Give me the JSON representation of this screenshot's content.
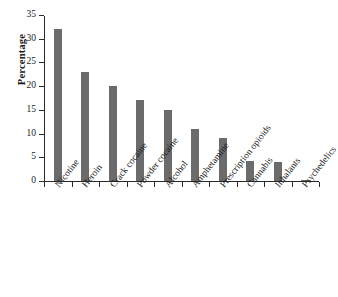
{
  "chart_data": {
    "type": "bar",
    "title": "",
    "xlabel": "",
    "ylabel": "Percentage",
    "categories": [
      "Nicotine",
      "Heroin",
      "Crack cocaine",
      "Powder cocaine",
      "Alcohol",
      "Amphetamine",
      "Prescription opioids",
      "Cannabis",
      "Inhalants",
      "Psychedelics"
    ],
    "values": [
      32,
      23,
      20,
      17,
      15,
      11,
      9,
      4.3,
      4,
      0.2
    ],
    "ylim": [
      0,
      35
    ],
    "yticks": [
      0,
      5,
      10,
      15,
      20,
      25,
      30,
      35
    ],
    "ytick_labels": [
      "0",
      "5",
      "10",
      "15",
      "20",
      "25",
      "30",
      "35"
    ],
    "grid": false,
    "legend": false,
    "bar_color": "#6b6b6b",
    "axis_color": "#2b2b2b"
  }
}
